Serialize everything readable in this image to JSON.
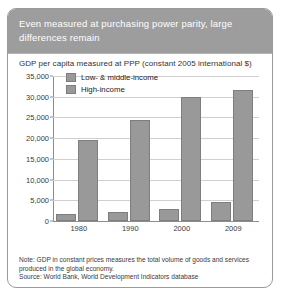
{
  "figure": {
    "header_title": "Even measured at purchasing power parity, large differences remain",
    "note": "Note: GDP in constant prices measures the total volume of goods and services produced in the global economy.",
    "source": "Source: World Bank, World Development Indicators database"
  },
  "chart_data": {
    "type": "bar",
    "title": "GDP per capita measured at PPP (constant 2005 international $)",
    "xlabel": "",
    "ylabel": "",
    "categories": [
      "1980",
      "1990",
      "2000",
      "2009"
    ],
    "series": [
      {
        "name": "Low- & middle-income",
        "values": [
          1700,
          2200,
          2900,
          4500
        ],
        "color": "#999999"
      },
      {
        "name": "High-income",
        "values": [
          19500,
          24500,
          30000,
          31700
        ],
        "color": "#999999"
      }
    ],
    "ylim": [
      0,
      35000
    ],
    "ytick_values": [
      0,
      5000,
      10000,
      15000,
      20000,
      25000,
      30000,
      35000
    ],
    "ytick_labels": [
      "0",
      "5,000",
      "10,000",
      "15,000",
      "20,000",
      "25,000",
      "30,000",
      "35,000"
    ],
    "grid": true,
    "legend_position": "upper-left-inside"
  }
}
